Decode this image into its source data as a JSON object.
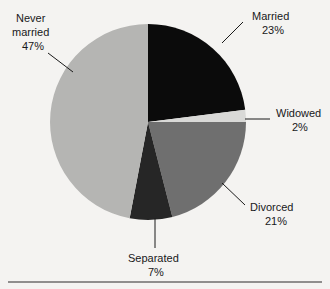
{
  "chart_data": {
    "type": "pie",
    "title": "",
    "subtitle": "",
    "xlabel": "",
    "ylabel": "",
    "legend_position": "none",
    "labels_outside": true,
    "start_angle_deg": 0,
    "direction": "clockwise",
    "categories": [
      "Married",
      "Widowed",
      "Divorced",
      "Separated",
      "Never married"
    ],
    "values": [
      23,
      2,
      21,
      7,
      47
    ],
    "unit": "%",
    "slices": [
      {
        "name": "Married",
        "label": "Married",
        "value": 23,
        "value_text": "23%",
        "color": "#0b0b0b",
        "start_deg": 0,
        "end_deg": 82.8
      },
      {
        "name": "Widowed",
        "label": "Widowed",
        "value": 2,
        "value_text": "2%",
        "color": "#d9d9d7",
        "start_deg": 82.8,
        "end_deg": 90.0
      },
      {
        "name": "Divorced",
        "label": "Divorced",
        "value": 21,
        "value_text": "21%",
        "color": "#6f6f6f",
        "start_deg": 90.0,
        "end_deg": 165.6
      },
      {
        "name": "Separated",
        "label": "Separated",
        "value": 7,
        "value_text": "7%",
        "color": "#262626",
        "start_deg": 165.6,
        "end_deg": 190.8
      },
      {
        "name": "Never married",
        "label_line1": "Never",
        "label_line2": "married",
        "label": "Never married",
        "value": 47,
        "value_text": "47%",
        "color": "#b5b5b3",
        "start_deg": 190.8,
        "end_deg": 360.0
      }
    ]
  },
  "labels": {
    "married": {
      "text": "Married",
      "pct": "23%"
    },
    "widowed": {
      "text": "Widowed",
      "pct": "2%"
    },
    "divorced": {
      "text": "Divorced",
      "pct": "21%"
    },
    "separated": {
      "text": "Separated",
      "pct": "7%"
    },
    "never_married": {
      "line1": "Never",
      "line2": "married",
      "pct": "47%"
    }
  },
  "colors": {
    "background": "#f4f3f1",
    "married": "#0b0b0b",
    "widowed": "#d9d9d7",
    "divorced": "#6f6f6f",
    "separated": "#262626",
    "never_married": "#b5b5b3",
    "text": "#18181a",
    "leader": "#1a1a1a",
    "rule": "#2b2b2b"
  }
}
